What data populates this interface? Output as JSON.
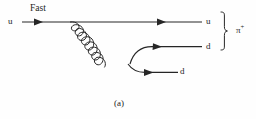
{
  "figure": {
    "caption": "(a)",
    "type": "feynman-diagram",
    "stroke_color": "#262626",
    "background_color": "#fefefe"
  },
  "labels": {
    "incoming_quark": "u",
    "speed_annotation": "Fast",
    "outgoing_quark_top": "u",
    "outgoing_quark_upper_d": "d",
    "outgoing_quark_lower_d": "d",
    "meson": "π",
    "meson_charge": "+"
  },
  "lines": {
    "top_fermion": {
      "name": "u-quark-line",
      "from_x": 22,
      "from_y": 22,
      "to_x": 202,
      "to_y": 22,
      "arrow_at_x": 40,
      "arrow_at_x2": 163
    },
    "gluon": {
      "name": "gluon-propagator",
      "from_x": 70,
      "from_y": 22,
      "to_x": 133,
      "to_y": 63,
      "coils": 8,
      "style": "helix"
    },
    "upper_branch": {
      "name": "d-quark-upper",
      "from_x": 133,
      "from_y": 62,
      "to_x": 202,
      "to_y": 47,
      "arrow_at_x": 160
    },
    "lower_branch": {
      "name": "d-quark-lower",
      "from_x": 133,
      "from_y": 63,
      "to_x": 178,
      "to_y": 72,
      "arrow_at_x": 152
    },
    "brace": {
      "name": "pion-grouping-brace",
      "x": 224,
      "top_y": 12,
      "bottom_y": 50,
      "mid_y": 31
    }
  }
}
